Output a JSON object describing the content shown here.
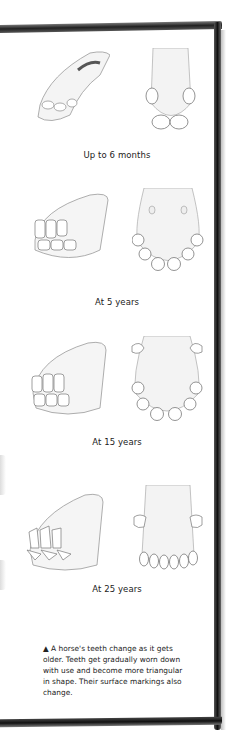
{
  "stages": [
    {
      "label": "Up to 6 months",
      "side_view": "young-jaw-side",
      "front_view": "young-incisors-front"
    },
    {
      "label": "At 5 years",
      "side_view": "5yr-jaw-side",
      "front_view": "5yr-incisors-front"
    },
    {
      "label": "At 15 years",
      "side_view": "15yr-jaw-side",
      "front_view": "15yr-incisors-front"
    },
    {
      "label": "At 25 years",
      "side_view": "25yr-jaw-side",
      "front_view": "25yr-incisors-front"
    }
  ],
  "note": {
    "marker": "▲",
    "text": "A horse's teeth change as it gets older. Teeth get gradually worn down with use and become more triangular in shape. Their surface markings also change."
  },
  "colors": {
    "frame": "#1a1a1a",
    "text": "#222222",
    "sketch": "#9a9a9a"
  }
}
